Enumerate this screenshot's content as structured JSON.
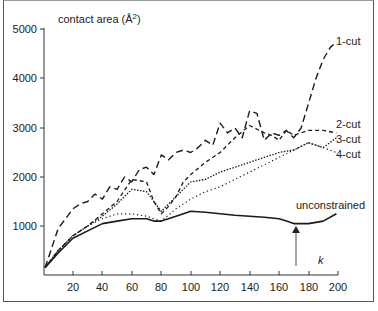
{
  "chart_data": {
    "type": "line",
    "title": "",
    "ylabel": "contact area (Å²)",
    "xlabel": "k",
    "xlim": [
      0,
      200
    ],
    "ylim": [
      0,
      5000
    ],
    "x_ticks": [
      20,
      40,
      60,
      80,
      100,
      120,
      140,
      160,
      180,
      200
    ],
    "y_ticks": [
      1000,
      2000,
      3000,
      4000,
      5000
    ],
    "grid": false,
    "legend_position": "inline-right",
    "annotations": [
      {
        "text": "k",
        "x": 172,
        "arrow_to_y": 1050
      }
    ],
    "series": [
      {
        "name": "1-cut",
        "style": "long-dash",
        "x": [
          1,
          5,
          10,
          15,
          20,
          25,
          30,
          35,
          40,
          45,
          50,
          55,
          60,
          65,
          70,
          75,
          80,
          85,
          90,
          95,
          100,
          105,
          110,
          115,
          120,
          125,
          130,
          135,
          140,
          145,
          150,
          155,
          160,
          165,
          170,
          175,
          180,
          185,
          190,
          195,
          199
        ],
        "values": [
          150,
          500,
          950,
          1150,
          1350,
          1450,
          1500,
          1650,
          1550,
          1800,
          1750,
          2000,
          1900,
          2150,
          2200,
          2050,
          2450,
          2350,
          2500,
          2550,
          2500,
          2600,
          2750,
          2650,
          3100,
          2900,
          3000,
          2800,
          3350,
          3300,
          2750,
          2900,
          2850,
          2950,
          2800,
          3000,
          3500,
          4000,
          4400,
          4650,
          4750
        ]
      },
      {
        "name": "2-cut",
        "style": "dash",
        "x": [
          1,
          10,
          20,
          30,
          40,
          50,
          60,
          70,
          75,
          80,
          85,
          90,
          95,
          100,
          110,
          120,
          130,
          140,
          150,
          155,
          160,
          165,
          170,
          175,
          180,
          190,
          199
        ],
        "values": [
          150,
          500,
          800,
          1000,
          1250,
          1500,
          1950,
          1900,
          1500,
          1250,
          1400,
          1600,
          1900,
          2050,
          2300,
          2500,
          2800,
          3050,
          2900,
          2850,
          2750,
          2950,
          2850,
          2900,
          2950,
          2950,
          2900
        ]
      },
      {
        "name": "3-cut",
        "style": "dense-dot",
        "x": [
          1,
          10,
          20,
          30,
          40,
          50,
          60,
          70,
          80,
          90,
          100,
          110,
          120,
          130,
          140,
          150,
          160,
          170,
          180,
          190,
          199
        ],
        "values": [
          150,
          500,
          800,
          1000,
          1200,
          1450,
          1750,
          1700,
          1300,
          1600,
          1900,
          1950,
          2100,
          2200,
          2300,
          2400,
          2500,
          2550,
          2700,
          2600,
          2800
        ]
      },
      {
        "name": "4-cut",
        "style": "sparse-dot",
        "x": [
          1,
          10,
          20,
          30,
          40,
          50,
          60,
          70,
          80,
          90,
          100,
          110,
          120,
          130,
          140,
          150,
          160,
          170,
          180,
          190,
          199
        ],
        "values": [
          150,
          500,
          800,
          1000,
          1150,
          1250,
          1250,
          1200,
          1100,
          1350,
          1550,
          1700,
          1800,
          1950,
          2100,
          2250,
          2400,
          2550,
          2700,
          2600,
          2500
        ]
      },
      {
        "name": "unconstrained",
        "style": "solid",
        "x": [
          1,
          10,
          20,
          30,
          40,
          50,
          60,
          70,
          75,
          80,
          90,
          100,
          110,
          120,
          130,
          140,
          150,
          160,
          165,
          170,
          175,
          180,
          190,
          199
        ],
        "values": [
          150,
          450,
          750,
          900,
          1050,
          1100,
          1150,
          1150,
          1100,
          1100,
          1200,
          1300,
          1280,
          1250,
          1220,
          1200,
          1180,
          1150,
          1100,
          1050,
          1050,
          1050,
          1100,
          1250
        ]
      }
    ]
  },
  "labels": {
    "ylabel": "contact area (Å",
    "ylabel_sup": "2",
    "ylabel_close": ")",
    "k": "k",
    "s1": "1-cut",
    "s2": "2-cut",
    "s3": "3-cut",
    "s4": "4-cut",
    "s5": "unconstrained",
    "y5000": "5000",
    "y4000": "4000",
    "y3000": "3000",
    "y2000": "2000",
    "y1000": "1000",
    "x20": "20",
    "x40": "40",
    "x60": "60",
    "x80": "80",
    "x100": "100",
    "x120": "120",
    "x140": "140",
    "x160": "160",
    "x180": "180",
    "x200": "200"
  }
}
